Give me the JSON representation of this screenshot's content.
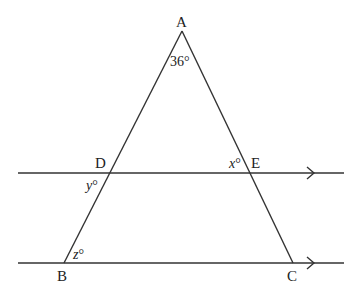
{
  "diagram": {
    "type": "geometry",
    "colors": {
      "line": "#333333",
      "text": "#222222",
      "background": "#ffffff"
    },
    "points": {
      "A": {
        "label": "A",
        "x": 182,
        "y": 31
      },
      "B": {
        "label": "B",
        "x": 64,
        "y": 263
      },
      "C": {
        "label": "C",
        "x": 293,
        "y": 263
      },
      "D": {
        "label": "D",
        "x": 110,
        "y": 173
      },
      "E": {
        "label": "E",
        "x": 246,
        "y": 173
      }
    },
    "parallel_lines": [
      {
        "name": "line-DE",
        "x1": 18,
        "y1": 173,
        "x2": 344,
        "y2": 173,
        "arrow_x": 313
      },
      {
        "name": "line-BC",
        "x1": 18,
        "y1": 263,
        "x2": 344,
        "y2": 263,
        "arrow_x": 313
      }
    ],
    "angles": {
      "A": {
        "value": "36",
        "unit": "°",
        "text": "36°"
      },
      "x": {
        "var": "x",
        "unit": "°",
        "location": "at E, inside triangle between AE and DE"
      },
      "y": {
        "var": "y",
        "unit": "°",
        "location": "at D, below DE on left of AB"
      },
      "z": {
        "var": "z",
        "unit": "°",
        "location": "at B, between BA and BC"
      }
    },
    "labels": {
      "A": "A",
      "B": "B",
      "C": "C",
      "D": "D",
      "E": "E",
      "angle_A": "36°",
      "x_var": "x",
      "y_var": "y",
      "z_var": "z",
      "deg": "°"
    }
  }
}
